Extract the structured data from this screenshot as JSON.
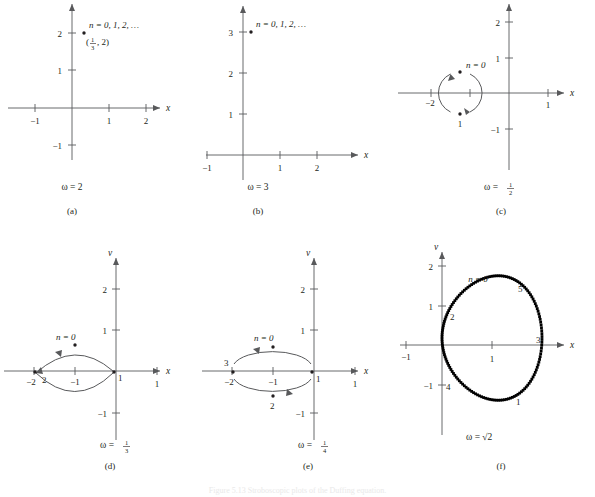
{
  "figure": {
    "caption": "Figure 5.13 Stroboscopic plots of the Duffing equation.",
    "axis_labels": {
      "x": "x",
      "v": "v",
      "y_top_row": ""
    }
  },
  "panels": [
    {
      "id": "a",
      "sublabel": "(a)",
      "omega": "ω = 2",
      "omega_plain": "2",
      "xaxis_name": "x",
      "yaxis_name": "",
      "xticks": [
        "−1",
        "1",
        "2"
      ],
      "yticks": [
        "2",
        "1",
        "−1"
      ],
      "point_label": "n = 0, 1, 2, …",
      "coord_label": "(⅓, 2)",
      "coord_num": "1",
      "coord_den": "3",
      "coord_second": ", 2)",
      "points": [
        {
          "x": 0.333,
          "y": 2,
          "label": ""
        }
      ]
    },
    {
      "id": "b",
      "sublabel": "(b)",
      "omega": "ω = 3",
      "omega_plain": "3",
      "xaxis_name": "x",
      "yaxis_name": "",
      "xticks": [
        "−1",
        "1",
        "2"
      ],
      "yticks": [
        "3",
        "2",
        "1"
      ],
      "point_label": "n = 0, 1, 2, …",
      "points": [
        {
          "x": 0.12,
          "y": 3,
          "label": ""
        }
      ]
    },
    {
      "id": "c",
      "sublabel": "(c)",
      "omega": "ω =",
      "omega_num": "1",
      "omega_den": "2",
      "xaxis_name": "x",
      "yaxis_name": "",
      "xticks": [
        "−2",
        "1"
      ],
      "yticks": [
        "2",
        "1",
        "−1"
      ],
      "orbit_type": "circle",
      "points": [
        {
          "x": -1.5,
          "y": 0.52,
          "label": "n = 0"
        },
        {
          "x": -1.5,
          "y": -0.52,
          "label": "1"
        }
      ]
    },
    {
      "id": "d",
      "sublabel": "(d)",
      "omega": "ω =",
      "omega_num": "1",
      "omega_den": "3",
      "xaxis_name": "x",
      "yaxis_name": "v",
      "xticks": [
        "−2",
        "−1",
        "1"
      ],
      "yticks": [
        "2",
        "1",
        "−1"
      ],
      "orbit_type": "lens",
      "points": [
        {
          "x": -1.0,
          "y": 0.28,
          "label": "n = 0"
        },
        {
          "x": 0.0,
          "y": 0.0,
          "label": "1"
        },
        {
          "x": -2.0,
          "y": 0.0,
          "label": "2"
        }
      ]
    },
    {
      "id": "e",
      "sublabel": "(e)",
      "omega": "ω =",
      "omega_num": "1",
      "omega_den": "4",
      "xaxis_name": "x",
      "yaxis_name": "v",
      "xticks": [
        "−2",
        "−1",
        "1"
      ],
      "yticks": [
        "2",
        "1",
        "−1"
      ],
      "orbit_type": "ellipse",
      "points": [
        {
          "x": -1.0,
          "y": 0.38,
          "label": "n = 0"
        },
        {
          "x": 0.0,
          "y": 0.0,
          "label": "1"
        },
        {
          "x": -1.0,
          "y": -0.38,
          "label": "2"
        },
        {
          "x": -2.0,
          "y": 0.0,
          "label": "3"
        }
      ]
    },
    {
      "id": "f",
      "sublabel": "(f)",
      "omega": "ω = √2",
      "omega_plain": "√2",
      "xaxis_name": "x",
      "yaxis_name": "v",
      "xticks": [
        "−1",
        "1"
      ],
      "yticks": [
        "2",
        "1",
        "−1"
      ],
      "orbit_type": "dotted-ellipse",
      "point_labels": [
        {
          "text": "n = 0",
          "x": 1.0,
          "y": 1.85
        },
        {
          "text": "5",
          "x": 1.85,
          "y": 1.55
        },
        {
          "text": "3",
          "x": 2.15,
          "y": 0.12
        },
        {
          "text": "1",
          "x": 1.85,
          "y": -1.72
        },
        {
          "text": "4",
          "x": 0.12,
          "y": -1.05
        },
        {
          "text": "2",
          "x": 0.22,
          "y": 0.72
        }
      ]
    }
  ],
  "chart_data": {
    "type": "scatter",
    "title": "Stroboscopic plots of the Duffing equation",
    "xlabel": "x",
    "ylabel": "v",
    "panels": [
      {
        "name": "(a)",
        "omega": 2,
        "points": [
          [
            0.333,
            2
          ]
        ],
        "annotation": "n = 0, 1, 2, …"
      },
      {
        "name": "(b)",
        "omega": 3,
        "points": [
          [
            0.12,
            3
          ]
        ],
        "annotation": "n = 0, 1, 2, …"
      },
      {
        "name": "(c)",
        "omega": 0.5,
        "points": [
          [
            -1.5,
            0.52
          ],
          [
            -1.5,
            -0.52
          ]
        ],
        "annotation": "period-2 cycle"
      },
      {
        "name": "(d)",
        "omega": 0.3333,
        "points": [
          [
            -1.0,
            0.28
          ],
          [
            0.0,
            0.0
          ],
          [
            -2.0,
            0.0
          ]
        ],
        "annotation": "period-3 cycle"
      },
      {
        "name": "(e)",
        "omega": 0.25,
        "points": [
          [
            -1.0,
            0.38
          ],
          [
            0.0,
            0.0
          ],
          [
            -1.0,
            -0.38
          ],
          [
            -2.0,
            0.0
          ]
        ],
        "annotation": "period-4 cycle"
      },
      {
        "name": "(f)",
        "omega": 1.4142,
        "points": [],
        "annotation": "quasi-periodic closed curve"
      }
    ]
  }
}
